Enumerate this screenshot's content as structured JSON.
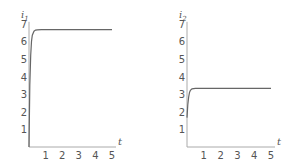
{
  "chart_data": [
    {
      "type": "line",
      "title": "",
      "ylabel": "i1",
      "ylabel_base": "i",
      "ylabel_sub": "1",
      "xlabel": "t",
      "xlim": [
        0,
        5
      ],
      "ylim": [
        0,
        7
      ],
      "xticks": [
        "1",
        "2",
        "3",
        "4",
        "5"
      ],
      "yticks": [
        "1",
        "2",
        "3",
        "4",
        "5",
        "6",
        "7"
      ],
      "grid": false,
      "series": [
        {
          "name": "i1",
          "x": [
            0,
            0.05,
            0.1,
            0.15,
            0.2,
            0.3,
            0.4,
            0.5,
            0.75,
            1,
            2,
            3,
            4,
            5
          ],
          "values": [
            0,
            3.5,
            5.2,
            6.0,
            6.35,
            6.58,
            6.64,
            6.66,
            6.67,
            6.67,
            6.67,
            6.67,
            6.67,
            6.67
          ]
        }
      ]
    },
    {
      "type": "line",
      "title": "",
      "ylabel": "i2",
      "ylabel_base": "i",
      "ylabel_sub": "2",
      "xlabel": "t",
      "xlim": [
        0,
        5
      ],
      "ylim": [
        0,
        7
      ],
      "xticks": [
        "1",
        "2",
        "3",
        "4",
        "5"
      ],
      "yticks": [
        "1",
        "2",
        "3",
        "4",
        "5",
        "6",
        "7"
      ],
      "grid": false,
      "series": [
        {
          "name": "i2",
          "x": [
            0,
            0.05,
            0.1,
            0.15,
            0.2,
            0.3,
            0.4,
            0.5,
            0.75,
            1,
            2,
            3,
            4,
            5
          ],
          "values": [
            1.67,
            2.4,
            2.85,
            3.1,
            3.22,
            3.3,
            3.32,
            3.33,
            3.33,
            3.33,
            3.33,
            3.33,
            3.33,
            3.33
          ]
        }
      ]
    }
  ]
}
